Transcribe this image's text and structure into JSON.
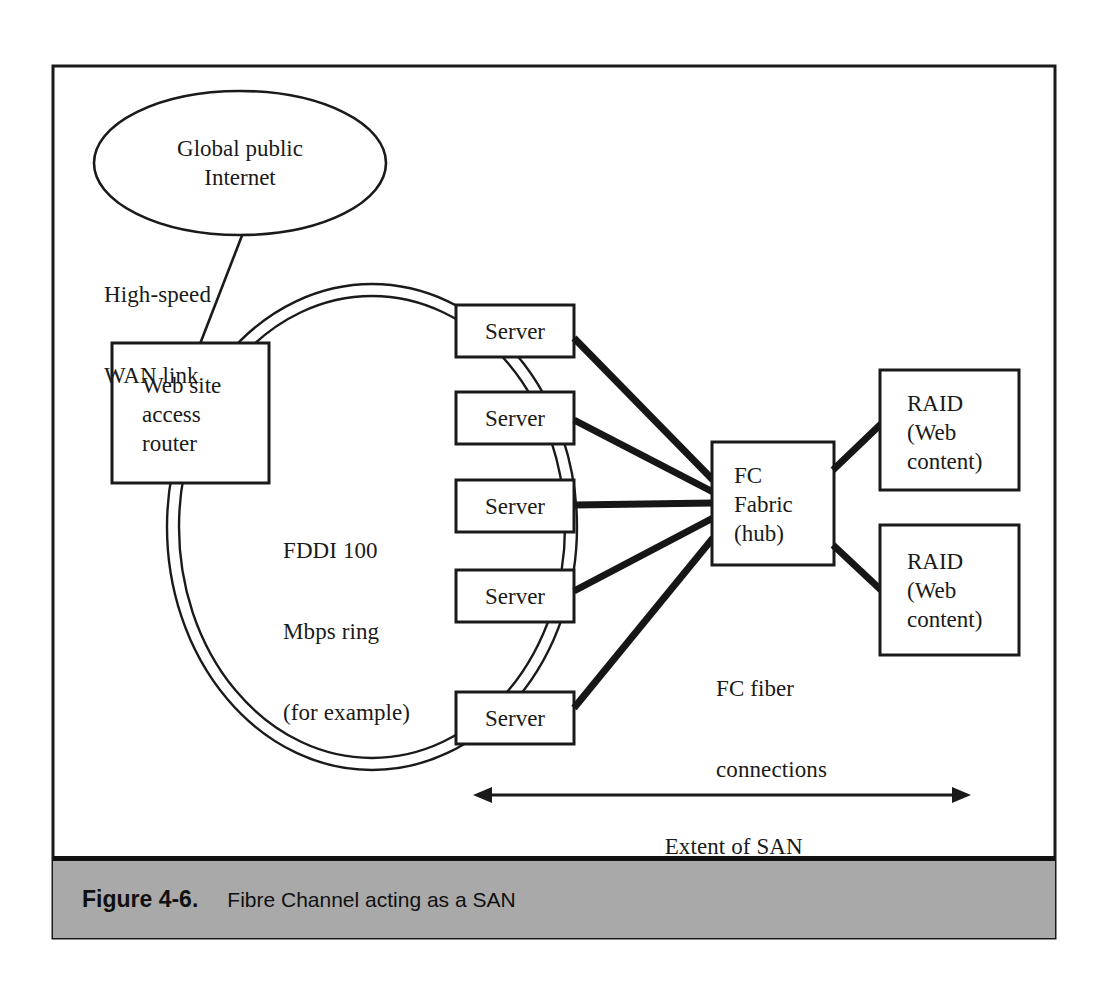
{
  "figure": {
    "caption_number": "Figure 4-6.",
    "caption_text": "Fibre Channel acting as a SAN"
  },
  "nodes": {
    "internet": {
      "label_line1": "Global public",
      "label_line2": "Internet",
      "shape": "ellipse"
    },
    "router": {
      "label_line1": "Web site",
      "label_line2": "access",
      "label_line3": "router",
      "shape": "rect"
    },
    "fabric": {
      "label_line1": "FC",
      "label_line2": "Fabric",
      "label_line3": "(hub)",
      "shape": "rect"
    },
    "servers": [
      {
        "label": "Server"
      },
      {
        "label": "Server"
      },
      {
        "label": "Server"
      },
      {
        "label": "Server"
      },
      {
        "label": "Server"
      }
    ],
    "raids": [
      {
        "label_line1": "RAID",
        "label_line2": "(Web",
        "label_line3": "content)"
      },
      {
        "label_line1": "RAID",
        "label_line2": "(Web",
        "label_line3": "content)"
      }
    ]
  },
  "annotations": {
    "wan_link_line1": "High-speed",
    "wan_link_line2": "WAN link",
    "ring_line1": "FDDI 100",
    "ring_line2": "Mbps ring",
    "ring_line3": "(for example)",
    "fc_fiber_line1": "FC fiber",
    "fc_fiber_line2": "connections",
    "extent_label": "Extent of SAN"
  },
  "colors": {
    "ink": "#1a1a1a",
    "thick_line": "#161616",
    "caption_bar": "#a9a9a9",
    "frame": "#1a1a1a",
    "page": "#ffffff"
  }
}
